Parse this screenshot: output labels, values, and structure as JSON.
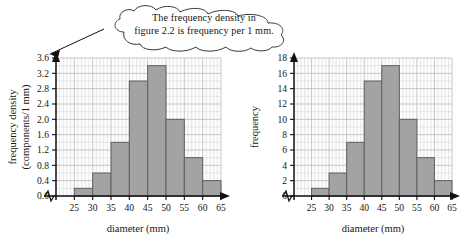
{
  "callout": {
    "name": "frequency-density-note",
    "line1": "The frequency density in",
    "line2": "figure 2.2 is frequency per 1 mm.",
    "full_text": "The frequency density in figure 2.2 is frequency per 1 mm."
  },
  "style": {
    "bar_fill": "#a3a3a3",
    "bar_stroke": "#5f5f5f",
    "grid_minor": "#d9d9d9",
    "grid_major": "#bdbdbd",
    "axis": "#111111",
    "plot_bg": "#fdfdfd",
    "text": "#161616"
  },
  "chart_data": [
    {
      "id": "frequency-density-histogram",
      "type": "bar",
      "title": "",
      "xlabel": "diameter (mm)",
      "ylabel": "frequency density (components/1 mm)",
      "ylabel_line1": "frequency density",
      "ylabel_line2": "(components/1 mm)",
      "xlim": [
        20,
        65
      ],
      "ylim": [
        0.0,
        3.6
      ],
      "grid": true,
      "legend": "none",
      "axis_break_x": true,
      "xticks": [
        25,
        30,
        35,
        40,
        45,
        50,
        55,
        60,
        65
      ],
      "xtick_labels": [
        "25",
        "30",
        "35",
        "40",
        "45",
        "50",
        "55",
        "60",
        "65"
      ],
      "yticks": [
        0.0,
        0.4,
        0.8,
        1.2,
        1.6,
        2.0,
        2.4,
        2.8,
        3.2,
        3.6
      ],
      "ytick_labels": [
        "0.0",
        "0.4",
        "0.8",
        "1.2",
        "1.6",
        "2.0",
        "2.4",
        "2.8",
        "3.2",
        "3.6"
      ],
      "bins": [
        {
          "from": 25,
          "to": 30,
          "value": 0.2
        },
        {
          "from": 30,
          "to": 35,
          "value": 0.6
        },
        {
          "from": 35,
          "to": 40,
          "value": 1.4
        },
        {
          "from": 40,
          "to": 45,
          "value": 3.0
        },
        {
          "from": 45,
          "to": 50,
          "value": 3.4
        },
        {
          "from": 50,
          "to": 55,
          "value": 2.0
        },
        {
          "from": 55,
          "to": 60,
          "value": 1.0
        },
        {
          "from": 60,
          "to": 65,
          "value": 0.4
        }
      ],
      "categories": [
        "25-30",
        "30-35",
        "35-40",
        "40-45",
        "45-50",
        "50-55",
        "55-60",
        "60-65"
      ],
      "values": [
        0.2,
        0.6,
        1.4,
        3.0,
        3.4,
        2.0,
        1.0,
        0.4
      ]
    },
    {
      "id": "frequency-histogram",
      "type": "bar",
      "title": "",
      "xlabel": "diameter (mm)",
      "ylabel": "frequency",
      "xlim": [
        20,
        65
      ],
      "ylim": [
        0,
        18
      ],
      "grid": true,
      "legend": "none",
      "axis_break_x": true,
      "xticks": [
        25,
        30,
        35,
        40,
        45,
        50,
        55,
        60,
        65
      ],
      "xtick_labels": [
        "25",
        "30",
        "35",
        "40",
        "45",
        "50",
        "55",
        "60",
        "65"
      ],
      "yticks": [
        0,
        2,
        4,
        6,
        8,
        10,
        12,
        14,
        16,
        18
      ],
      "ytick_labels": [
        "0",
        "2",
        "4",
        "6",
        "8",
        "10",
        "12",
        "14",
        "16",
        "18"
      ],
      "bins": [
        {
          "from": 25,
          "to": 30,
          "value": 1
        },
        {
          "from": 30,
          "to": 35,
          "value": 3
        },
        {
          "from": 35,
          "to": 40,
          "value": 7
        },
        {
          "from": 40,
          "to": 45,
          "value": 15
        },
        {
          "from": 45,
          "to": 50,
          "value": 17
        },
        {
          "from": 50,
          "to": 55,
          "value": 10
        },
        {
          "from": 55,
          "to": 60,
          "value": 5
        },
        {
          "from": 60,
          "to": 65,
          "value": 2
        }
      ],
      "categories": [
        "25-30",
        "30-35",
        "35-40",
        "40-45",
        "45-50",
        "50-55",
        "55-60",
        "60-65"
      ],
      "values": [
        1,
        3,
        7,
        15,
        17,
        10,
        5,
        2
      ]
    }
  ]
}
